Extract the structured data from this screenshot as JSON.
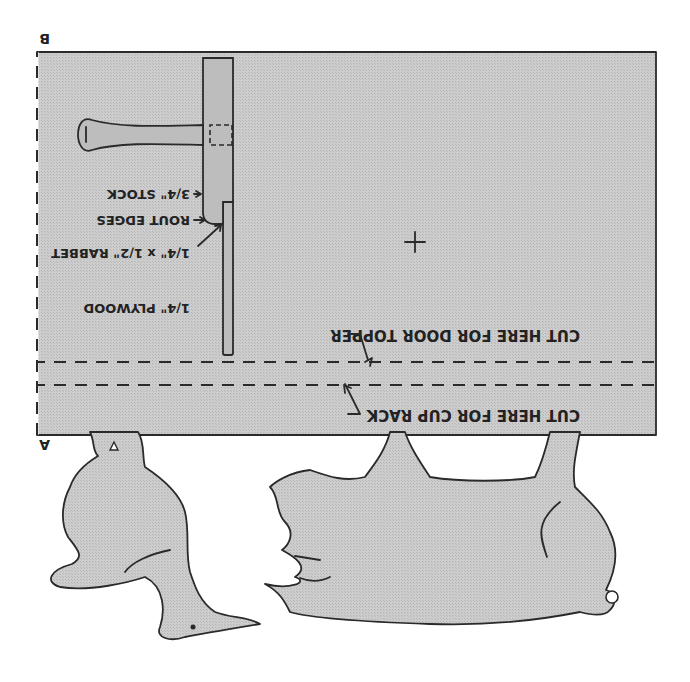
{
  "diagram": {
    "orientation": "rotated 180 degrees",
    "corner_labels": {
      "a": "A",
      "b": "B"
    },
    "cut_lines": [
      {
        "label": "CUT HERE FOR DOOR TOPPER"
      },
      {
        "label": "CUT HERE FOR CUP RACK"
      }
    ],
    "section_callouts": [
      {
        "label": "3/4\" STOCK"
      },
      {
        "label": "ROUT EDGES"
      },
      {
        "label": "1/4\" x 1/2\" RABBET"
      },
      {
        "label": "1/4\" PLYWOOD"
      }
    ],
    "shapes": [
      "rectangular panel",
      "crosshair center mark",
      "knob / peg section view",
      "goose cutout",
      "pig cutout"
    ],
    "colors": {
      "fill": "#c8c8c8",
      "ink": "#2a2a2a",
      "background": "#ffffff"
    }
  }
}
